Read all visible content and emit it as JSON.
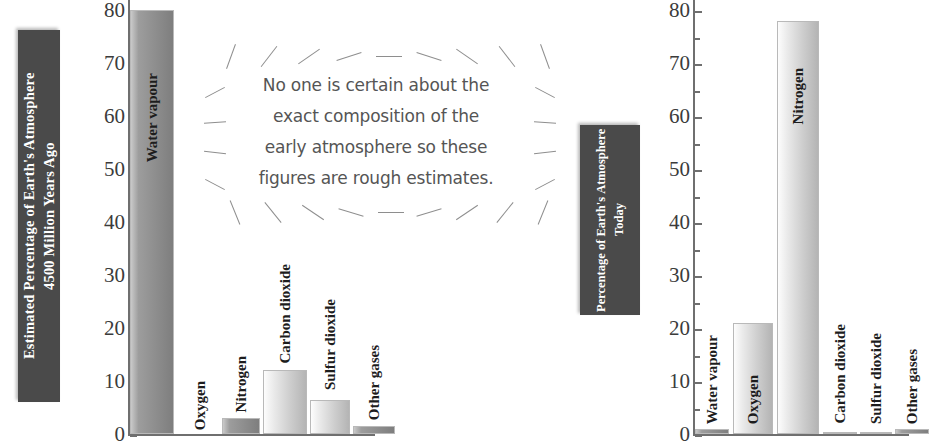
{
  "charts": {
    "left": {
      "title_line1": "Estimated Percentage of Earth's Atmosphere",
      "title_line2": "4500 Million Years Ago",
      "title_full": "Estimated Percentage of Earth's Atmosphere 4500 Million Years Ago"
    },
    "right": {
      "title_line1": "Percentage of Earth's",
      "title_line2": "Atmosphere Today",
      "title_full": "Percentage of Earth's Atmosphere Today"
    }
  },
  "annotation": {
    "line1": "No one is certain about the",
    "line2": "exact composition of the",
    "line3": "early atmosphere so these",
    "line4": "figures are rough estimates.",
    "full": "No one is certain about the exact composition of the early atmosphere so these figures are rough estimates."
  },
  "axis": {
    "ticks": [
      "80",
      "70",
      "60",
      "50",
      "40",
      "30",
      "20",
      "10",
      "0"
    ],
    "min": 0,
    "max": 80,
    "step": 10
  },
  "colors": {
    "plaque_bg": "#4a4a4a",
    "plaque_text": "#ffffff",
    "bar_dark": "#8f8f8f",
    "bar_light": "#dcdcdc",
    "axis": "#6f6f6f",
    "annotation_text": "#555555",
    "page_bg": "#ffffff"
  },
  "chart_data": [
    {
      "type": "bar",
      "id": "early-atmosphere",
      "title": "Estimated Percentage of Earth's Atmosphere 4500 Million Years Ago",
      "xlabel": "",
      "ylabel": "",
      "ylim": [
        0,
        80
      ],
      "ytick_labels": [
        "0",
        "10",
        "20",
        "30",
        "40",
        "50",
        "60",
        "70",
        "80"
      ],
      "grid": false,
      "legend": "none",
      "categories": [
        "Water vapour",
        "Oxygen",
        "Nitrogen",
        "Carbon dioxide",
        "Sulfur dioxide",
        "Other gases"
      ],
      "values": [
        80,
        0,
        3,
        12,
        6.5,
        1.5
      ],
      "bar_shades": [
        "dark",
        "none",
        "dark",
        "light",
        "light",
        "dark"
      ],
      "note": "Water vapour bar is clipped at the top edge of the image"
    },
    {
      "type": "bar",
      "id": "today-atmosphere",
      "title": "Percentage of Earth's Atmosphere Today",
      "xlabel": "",
      "ylabel": "",
      "ylim": [
        0,
        80
      ],
      "ytick_labels": [
        "0",
        "10",
        "20",
        "30",
        "40",
        "50",
        "60",
        "70",
        "80"
      ],
      "grid": false,
      "legend": "none",
      "categories": [
        "Water vapour",
        "Oxygen",
        "Nitrogen",
        "Carbon dioxide",
        "Sulfur dioxide",
        "Other gases"
      ],
      "values": [
        1,
        21,
        78,
        0.4,
        0.2,
        1
      ],
      "bar_shades": [
        "dark",
        "light",
        "light",
        "dark",
        "dark",
        "dark"
      ],
      "note": "Nitrogen bar is clipped at the top edge of the image"
    }
  ]
}
